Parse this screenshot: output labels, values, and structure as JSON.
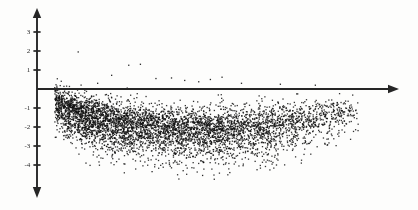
{
  "chart_data": {
    "type": "scatter",
    "title": "",
    "subtitle": "",
    "xlabel": "",
    "ylabel": "",
    "legend": [],
    "grid": false,
    "legend_position": "none",
    "n_points": 5000,
    "marker": {
      "shape": "square",
      "size_px": 1.3,
      "color": "#101010",
      "opacity": 0.85
    },
    "axes": {
      "x_axis": {
        "visible": true,
        "arrow": "right",
        "y_value": 0,
        "tick_labels": [],
        "xlim": [
          -0.18,
          4.45
        ],
        "pixel_start_x": 37,
        "pixel_end_x": 397,
        "pixel_y": 89
      },
      "y_axis": {
        "visible": true,
        "arrow": "both",
        "x_value": 0,
        "tick_values": [
          3,
          2,
          1,
          -1,
          -2,
          -3,
          -4
        ],
        "tick_labels": [
          "3",
          "2",
          "1",
          "-1",
          "-2",
          "-3",
          "-4"
        ],
        "ylim": [
          -5.2,
          4.1
        ],
        "pixel_x": 37,
        "pixel_top_y": 10,
        "pixel_bottom_y": 196,
        "pixel_zero_y": 89,
        "pixels_per_unit": 19
      }
    },
    "shape_profile": {
      "x_start": 0.05,
      "x_end": 3.95,
      "center_curve": [
        {
          "x": 0.05,
          "y": -0.75
        },
        {
          "x": 0.35,
          "y": -1.35
        },
        {
          "x": 0.75,
          "y": -1.75
        },
        {
          "x": 1.25,
          "y": -2.05
        },
        {
          "x": 1.75,
          "y": -2.2
        },
        {
          "x": 2.25,
          "y": -2.2
        },
        {
          "x": 2.75,
          "y": -2.05
        },
        {
          "x": 3.25,
          "y": -1.7
        },
        {
          "x": 3.65,
          "y": -1.4
        },
        {
          "x": 3.95,
          "y": -1.2
        }
      ],
      "spread": [
        {
          "x": 0.05,
          "sd": 0.42
        },
        {
          "x": 0.6,
          "sd": 0.55
        },
        {
          "x": 1.4,
          "sd": 0.6
        },
        {
          "x": 2.2,
          "sd": 0.62
        },
        {
          "x": 3.0,
          "sd": 0.55
        },
        {
          "x": 3.95,
          "sd": 0.4
        }
      ],
      "density": [
        {
          "x": 0.05,
          "weight": 1.0
        },
        {
          "x": 0.5,
          "weight": 1.0
        },
        {
          "x": 1.2,
          "weight": 0.85
        },
        {
          "x": 2.0,
          "weight": 0.72
        },
        {
          "x": 2.8,
          "weight": 0.55
        },
        {
          "x": 3.4,
          "weight": 0.32
        },
        {
          "x": 3.95,
          "weight": 0.12
        }
      ]
    },
    "outliers_above_axis": [
      {
        "x": 0.35,
        "y": 1.95
      },
      {
        "x": 1.0,
        "y": 1.25
      },
      {
        "x": 1.15,
        "y": 1.3
      },
      {
        "x": 0.78,
        "y": 0.72
      },
      {
        "x": 1.35,
        "y": 0.55
      },
      {
        "x": 1.55,
        "y": 0.58
      },
      {
        "x": 1.72,
        "y": 0.45
      },
      {
        "x": 2.05,
        "y": 0.5
      },
      {
        "x": 2.45,
        "y": 0.3
      },
      {
        "x": 2.95,
        "y": 0.25
      },
      {
        "x": 3.4,
        "y": 0.2
      },
      {
        "x": 0.6,
        "y": 0.3
      },
      {
        "x": 2.2,
        "y": 0.62
      },
      {
        "x": 1.9,
        "y": 0.38
      }
    ],
    "outliers_below": [
      {
        "x": 0.45,
        "y": -3.9
      },
      {
        "x": 1.3,
        "y": -4.35
      },
      {
        "x": 1.55,
        "y": -4.15
      },
      {
        "x": 1.95,
        "y": -4.55
      },
      {
        "x": 2.3,
        "y": -4.4
      },
      {
        "x": 2.65,
        "y": -4.25
      },
      {
        "x": 2.1,
        "y": -4.75
      },
      {
        "x": 1.7,
        "y": -4.3
      },
      {
        "x": 2.9,
        "y": -4.0
      },
      {
        "x": 0.95,
        "y": -3.95
      }
    ],
    "colors": {
      "background": "#fdfdfc",
      "axis": "#262626",
      "points": "#101010",
      "text": "#2a2a2a"
    }
  },
  "ticks": [
    {
      "label": "3",
      "value": 3,
      "top": 32
    },
    {
      "label": "2",
      "value": 2,
      "top": 51
    },
    {
      "label": "1",
      "value": 1,
      "top": 70
    },
    {
      "label": "-1",
      "value": -1,
      "top": 108
    },
    {
      "label": "-2",
      "value": -2,
      "top": 127
    },
    {
      "label": "-3",
      "value": -3,
      "top": 146
    },
    {
      "label": "-4",
      "value": -4,
      "top": 165
    }
  ]
}
